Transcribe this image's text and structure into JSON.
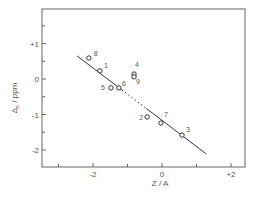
{
  "chart_data": {
    "type": "scatter",
    "title": "",
    "xlabel": "Z / A",
    "ylabel": "Δc / ppm",
    "ylabel_main": "Δ",
    "ylabel_sub": "c",
    "ylabel_unit": " / ppm",
    "xlim": [
      -3.0,
      2.4
    ],
    "ylim": [
      -2.5,
      2.0
    ],
    "x_ticks": [
      {
        "value": -2,
        "label": "-2"
      },
      {
        "value": 0,
        "label": "0"
      },
      {
        "value": 2,
        "label": "+2"
      }
    ],
    "x_minor_ticks": [
      -3,
      -1,
      1
    ],
    "y_ticks": [
      {
        "value": 1,
        "label": "+1"
      },
      {
        "value": 0,
        "label": "0"
      },
      {
        "value": -1,
        "label": "-1"
      },
      {
        "value": -2,
        "label": "-2"
      }
    ],
    "y_minor_ticks": [
      1.5,
      0.5,
      -0.5,
      -1.5
    ],
    "grid": false,
    "legend": null,
    "series": [
      {
        "name": "compounds",
        "marker": "open-circle",
        "points": [
          {
            "label": "8",
            "x": -2.12,
            "y": 0.59
          },
          {
            "label": "1",
            "x": -1.8,
            "y": 0.23
          },
          {
            "label": "5",
            "x": -1.48,
            "y": -0.25
          },
          {
            "label": "6",
            "x": -1.25,
            "y": -0.25
          },
          {
            "label": "4",
            "x": -0.81,
            "y": 0.14
          },
          {
            "label": "9",
            "x": -0.81,
            "y": 0.06
          },
          {
            "label": "2",
            "x": -0.43,
            "y": -1.07
          },
          {
            "label": "7",
            "x": -0.03,
            "y": -1.24
          },
          {
            "label": "3",
            "x": 0.58,
            "y": -1.58
          }
        ]
      }
    ],
    "fit_line": {
      "x_start": -2.46,
      "y_start": 0.65,
      "x_end": 1.28,
      "y_end": -2.11,
      "dotted_from_x": -1.16,
      "dotted_to_x": -0.46
    }
  },
  "style": {
    "axis_color": "#666666",
    "line_color": "#333333",
    "marker_color": "#333333",
    "text_color": "#555555"
  }
}
